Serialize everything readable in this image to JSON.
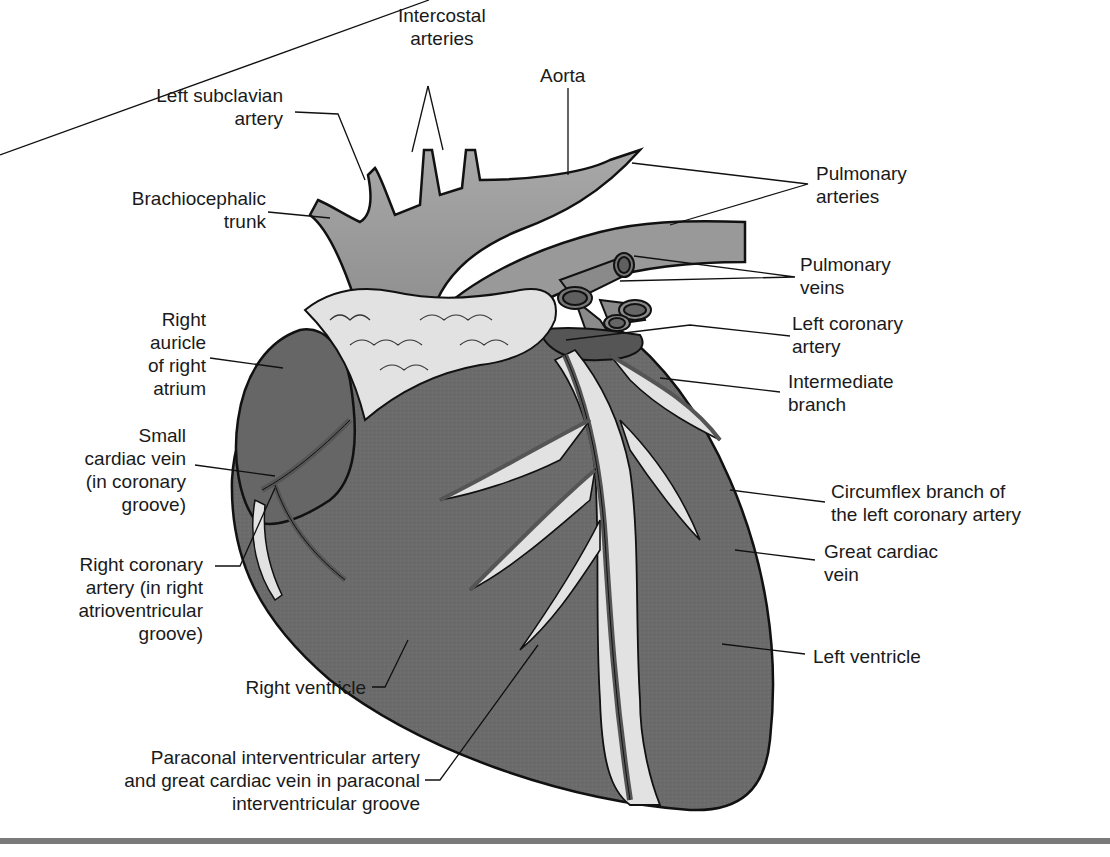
{
  "figure": {
    "colors": {
      "myocardium": "#6b6b6b",
      "great_vessels": "#9a9a9a",
      "fat": "#e2e2e2",
      "vessel_dark": "#5a5a5a",
      "outline": "#111111",
      "rule": "#7a7a7a"
    }
  },
  "labels": {
    "intercostal_arteries": "Intercostal\narteries",
    "aorta": "Aorta",
    "left_subclavian_artery": "Left subclavian\nartery",
    "brachiocephalic_trunk": "Brachiocephalic\ntrunk",
    "pulmonary_arteries": "Pulmonary\narteries",
    "pulmonary_veins": "Pulmonary\nveins",
    "left_coronary_artery": "Left coronary\nartery",
    "intermediate_branch": "Intermediate\nbranch",
    "right_auricle": "Right\nauricle\nof right\natrium",
    "small_cardiac_vein": "Small\ncardiac vein\n(in coronary\ngroove)",
    "right_coronary_artery": "Right coronary\nartery (in right\natrioventricular\ngroove)",
    "circumflex_branch": "Circumflex branch of\nthe left coronary artery",
    "great_cardiac_vein": "Great cardiac\nvein",
    "left_ventricle": "Left ventricle",
    "right_ventricle": "Right ventricle",
    "paraconal": "Paraconal interventricular artery\nand great cardiac vein in paraconal\ninterventricular groove"
  }
}
